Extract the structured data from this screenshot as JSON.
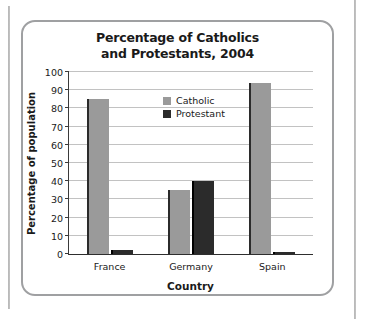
{
  "figure": {
    "title_line1": "Percentage of Catholics",
    "title_line2": "and Protestants, 2004"
  },
  "chart_data": {
    "type": "bar",
    "title": "Percentage of Catholics and Protestants, 2004",
    "xlabel": "Country",
    "ylabel": "Percentage of population",
    "categories": [
      "France",
      "Germany",
      "Spain"
    ],
    "series": [
      {
        "name": "Catholic",
        "color": "#9a9a9a",
        "values": [
          85,
          35,
          94
        ]
      },
      {
        "name": "Protestant",
        "color": "#2b2b2b",
        "values": [
          2,
          40,
          1
        ]
      }
    ],
    "ylim": [
      0,
      100
    ],
    "yticks": [
      0,
      10,
      20,
      30,
      40,
      50,
      60,
      70,
      80,
      90,
      100
    ],
    "ytick_labels": [
      "0",
      "10",
      "20",
      "30",
      "40",
      "50",
      "60",
      "70",
      "80",
      "90",
      "100"
    ],
    "grid": true,
    "legend_position": "top-center"
  },
  "legend": {
    "items": [
      {
        "label": "Catholic"
      },
      {
        "label": "Protestant"
      }
    ]
  }
}
